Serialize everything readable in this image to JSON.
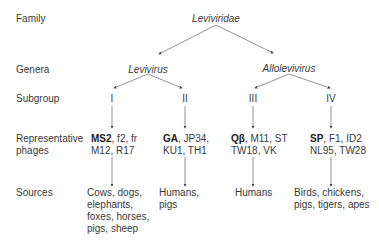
{
  "row_labels": {
    "family": "Family",
    "genera": "Genera",
    "subgroup": "Subgroup",
    "phages_line1": "Representative",
    "phages_line2": "phages",
    "sources": "Sources"
  },
  "family": {
    "name": "Leviviridae"
  },
  "genera": [
    {
      "name": "Levivirus"
    },
    {
      "name": "Allolevivirus"
    }
  ],
  "subgroups": [
    {
      "numeral": "I",
      "phages_bold": "MS2",
      "phages_rest1": ", f2, fr",
      "phages_line2": "M12, R17",
      "sources": [
        "Cows, dogs,",
        "elephants,",
        "foxes, horses,",
        "pigs, sheep"
      ]
    },
    {
      "numeral": "II",
      "phages_bold": "GA",
      "phages_rest1": ", JP34,",
      "phages_line2": "KU1, TH1",
      "sources": [
        "Humans,",
        "pigs"
      ]
    },
    {
      "numeral": "III",
      "phages_bold": "Qβ",
      "phages_rest1": ", M11, ST",
      "phages_line2": "TW18, VK",
      "sources": [
        "Humans"
      ]
    },
    {
      "numeral": "IV",
      "phages_bold": "SP",
      "phages_rest1": ", F1, ID2",
      "phages_line2": "NL95, TW28",
      "sources": [
        "Birds, chickens,",
        "pigs, tigers, apes"
      ]
    }
  ],
  "colors": {
    "text": "#3a3a3a",
    "line": "#666666"
  }
}
